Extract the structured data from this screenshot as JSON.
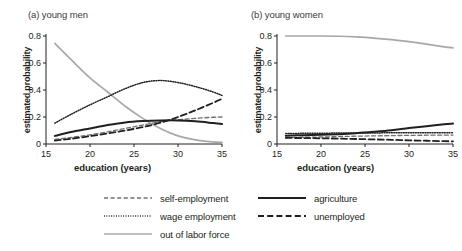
{
  "figure": {
    "width": 462,
    "height": 251,
    "background": "#ffffff"
  },
  "chart_data": [
    {
      "type": "line",
      "title": "(a) young men",
      "xlabel": "education (years)",
      "ylabel": "estimated probability",
      "xlim": [
        15,
        35
      ],
      "ylim": [
        0,
        0.8
      ],
      "xticks": [
        15,
        20,
        25,
        30,
        35
      ],
      "xtick_labels": [
        "15",
        "20",
        "25",
        "30",
        "35"
      ],
      "yticks": [
        0,
        0.2,
        0.4,
        0.6,
        0.8
      ],
      "ytick_labels": [
        "0",
        "0.2",
        "0.4",
        "0.6",
        "0.8"
      ],
      "grid": false,
      "legend_position": "below-figure",
      "x": [
        16,
        18,
        20,
        22,
        24,
        26,
        28,
        30,
        32,
        34,
        35
      ],
      "series": [
        {
          "name": "self-employment",
          "style": "dashed-gray",
          "color": "#595959",
          "values": [
            0.035,
            0.05,
            0.068,
            0.09,
            0.115,
            0.14,
            0.165,
            0.18,
            0.19,
            0.198,
            0.2
          ]
        },
        {
          "name": "wage employment",
          "style": "dotted",
          "color": "#231f20",
          "values": [
            0.155,
            0.225,
            0.29,
            0.35,
            0.41,
            0.455,
            0.47,
            0.455,
            0.425,
            0.385,
            0.36
          ]
        },
        {
          "name": "out of labor force",
          "style": "solid-gray",
          "color": "#a6a6a6",
          "values": [
            0.745,
            0.615,
            0.49,
            0.385,
            0.28,
            0.19,
            0.115,
            0.06,
            0.03,
            0.015,
            0.012
          ]
        },
        {
          "name": "agriculture",
          "style": "solid-black",
          "color": "#231f20",
          "values": [
            0.06,
            0.09,
            0.115,
            0.14,
            0.16,
            0.17,
            0.175,
            0.175,
            0.168,
            0.155,
            0.148
          ]
        },
        {
          "name": "unemployed",
          "style": "dashed-black",
          "color": "#231f20",
          "values": [
            0.025,
            0.04,
            0.058,
            0.078,
            0.1,
            0.125,
            0.158,
            0.2,
            0.25,
            0.305,
            0.335
          ]
        }
      ]
    },
    {
      "type": "line",
      "title": "(b) young women",
      "xlabel": "education (years)",
      "ylabel": "estimated probability",
      "xlim": [
        15,
        35
      ],
      "ylim": [
        0,
        0.8
      ],
      "xticks": [
        15,
        20,
        25,
        30,
        35
      ],
      "xtick_labels": [
        "15",
        "20",
        "25",
        "30",
        "35"
      ],
      "yticks": [
        0,
        0.2,
        0.4,
        0.6,
        0.8
      ],
      "ytick_labels": [
        "0",
        "0.2",
        "0.4",
        "0.6",
        "0.8"
      ],
      "grid": false,
      "legend_position": "below-figure",
      "x": [
        16,
        18,
        20,
        22,
        24,
        26,
        28,
        30,
        32,
        34,
        35
      ],
      "series": [
        {
          "name": "self-employment",
          "style": "dashed-gray",
          "color": "#595959",
          "values": [
            0.048,
            0.05,
            0.052,
            0.055,
            0.058,
            0.06,
            0.062,
            0.064,
            0.065,
            0.066,
            0.066
          ]
        },
        {
          "name": "wage employment",
          "style": "dotted",
          "color": "#231f20",
          "values": [
            0.078,
            0.079,
            0.08,
            0.081,
            0.082,
            0.082,
            0.083,
            0.083,
            0.083,
            0.083,
            0.083
          ]
        },
        {
          "name": "out of labor force",
          "style": "solid-gray",
          "color": "#a6a6a6",
          "values": [
            0.8,
            0.8,
            0.8,
            0.798,
            0.793,
            0.785,
            0.773,
            0.758,
            0.74,
            0.72,
            0.712
          ]
        },
        {
          "name": "agriculture",
          "style": "solid-black",
          "color": "#231f20",
          "values": [
            0.062,
            0.065,
            0.068,
            0.073,
            0.08,
            0.09,
            0.102,
            0.118,
            0.132,
            0.146,
            0.152
          ]
        },
        {
          "name": "unemployed",
          "style": "dashed-black",
          "color": "#231f20",
          "values": [
            0.045,
            0.044,
            0.042,
            0.04,
            0.037,
            0.034,
            0.031,
            0.027,
            0.024,
            0.021,
            0.02
          ]
        }
      ]
    }
  ],
  "legend": {
    "left_column": [
      {
        "label": "self-employment",
        "style": "dashed-gray"
      },
      {
        "label": "wage employment",
        "style": "dotted"
      },
      {
        "label": "out of labor force",
        "style": "solid-gray"
      }
    ],
    "right_column": [
      {
        "label": "agriculture",
        "style": "solid-black"
      },
      {
        "label": "unemployed",
        "style": "dashed-black"
      }
    ]
  }
}
